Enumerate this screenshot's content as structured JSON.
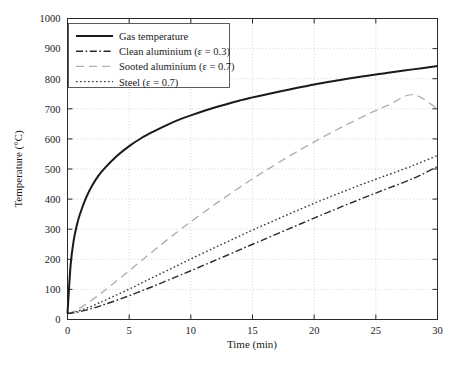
{
  "chart_data": {
    "type": "line",
    "title": "",
    "xlabel": "Time (min)",
    "ylabel": "Temperature (°C)",
    "xlim": [
      0,
      30
    ],
    "ylim": [
      0,
      1000
    ],
    "xticks": [
      0,
      5,
      10,
      15,
      20,
      25,
      30
    ],
    "yticks": [
      0,
      100,
      200,
      300,
      400,
      500,
      600,
      700,
      800,
      900,
      1000
    ],
    "xtick_labels": [
      "0",
      "5",
      "10",
      "15",
      "20",
      "25",
      "30"
    ],
    "ytick_labels": [
      "0",
      "100",
      "200",
      "300",
      "400",
      "500",
      "600",
      "700",
      "800",
      "900",
      "1000"
    ],
    "grid": true,
    "grid_style": "dotted",
    "legend_position": "upper left",
    "x": [
      0,
      0.25,
      0.5,
      0.75,
      1,
      1.5,
      2,
      2.5,
      3,
      4,
      5,
      6,
      7,
      8,
      9,
      10,
      12,
      14,
      15,
      16,
      18,
      20,
      22,
      24,
      25,
      26,
      28,
      30
    ],
    "series": [
      {
        "name": "Gas temperature",
        "style": "solid",
        "color": "#1a1a1a",
        "width": 2.0,
        "values": [
          20,
          180,
          262,
          312,
          349,
          404,
          445,
          477,
          502,
          543,
          576,
          603,
          625,
          645,
          663,
          678,
          705,
          728,
          738,
          747,
          764,
          781,
          795,
          808,
          814,
          820,
          831,
          842
        ]
      },
      {
        "name": "Clean aluminium (ε = 0.3)",
        "style": "dashdot",
        "color": "#2a2a2a",
        "width": 1.4,
        "values": [
          20,
          21,
          22,
          24,
          26,
          31,
          37,
          43,
          50,
          64,
          79,
          95,
          111,
          128,
          145,
          162,
          197,
          232,
          250,
          267,
          302,
          337,
          371,
          404,
          420,
          436,
          468,
          508
        ]
      },
      {
        "name": "Sooted aluminium (ε = 0.7)",
        "style": "longdash",
        "color": "#b0b0b0",
        "width": 1.4,
        "values": [
          20,
          23,
          27,
          32,
          38,
          51,
          65,
          80,
          96,
          129,
          162,
          196,
          229,
          262,
          294,
          325,
          384,
          440,
          467,
          493,
          543,
          590,
          634,
          675,
          694,
          712,
          747,
          700
        ]
      },
      {
        "name": "Steel (ε = 0.7)",
        "style": "dotted",
        "color": "#3a3a3a",
        "width": 1.4,
        "values": [
          20,
          22,
          24,
          27,
          30,
          37,
          45,
          54,
          63,
          82,
          101,
          121,
          141,
          161,
          181,
          201,
          240,
          278,
          297,
          315,
          351,
          386,
          419,
          451,
          466,
          481,
          511,
          545
        ]
      }
    ],
    "legend": [
      {
        "label": "Gas temperature",
        "style": "solid",
        "color": "#1a1a1a"
      },
      {
        "label": "Clean aluminium (ε = 0.3)",
        "style": "dashdot",
        "color": "#2a2a2a"
      },
      {
        "label": "Sooted aluminium (ε = 0.7)",
        "style": "longdash",
        "color": "#b0b0b0"
      },
      {
        "label": "Steel (ε = 0.7)",
        "style": "dotted",
        "color": "#3a3a3a"
      }
    ]
  }
}
